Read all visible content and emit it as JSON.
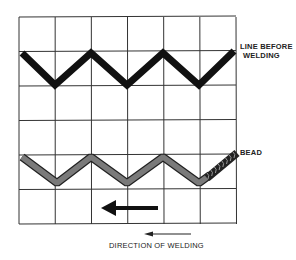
{
  "labels": {
    "line_before_welding": [
      "LINE BEFORE",
      "WELDING"
    ],
    "bead": "BEAD",
    "direction_of_welding": "DIRECTION OF WELDING"
  },
  "grid": {
    "columns": 6,
    "rows": 6
  },
  "colors": {
    "grid": "#333333",
    "line_before": "#111111",
    "bead_fill": "#777777",
    "bead_outline": "#222222",
    "arrow": "#111111"
  }
}
